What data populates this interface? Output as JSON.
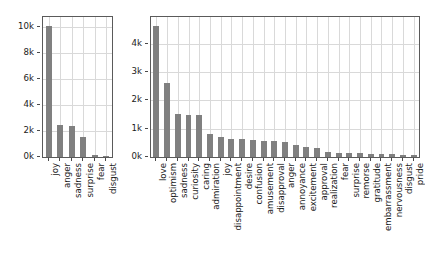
{
  "chart_data": [
    {
      "id": "ekman",
      "type": "bar",
      "title": "",
      "xlabel": "",
      "ylabel": "",
      "categories": [
        "joy",
        "anger",
        "sadness",
        "surprise",
        "fear",
        "disgust"
      ],
      "values": [
        10100,
        2500,
        2420,
        1520,
        160,
        30
      ],
      "ylim": [
        0,
        10800
      ],
      "yticks": [
        0,
        2000,
        4000,
        6000,
        8000,
        10000
      ],
      "ytick_labels": [
        "0k",
        "2k",
        "4k",
        "6k",
        "8k",
        "10k"
      ],
      "grid": true,
      "legend": "none",
      "bar_color": "#808080"
    },
    {
      "id": "goemotions",
      "type": "bar",
      "title": "",
      "xlabel": "",
      "ylabel": "",
      "categories": [
        "love",
        "optimism",
        "sadness",
        "curiosity",
        "caring",
        "admiration",
        "joy",
        "disappointment",
        "desire",
        "confusion",
        "amusement",
        "disapproval",
        "anger",
        "annoyance",
        "excitement",
        "approval",
        "realization",
        "fear",
        "surprise",
        "remorse",
        "gratitude",
        "embarrassment",
        "nervousness",
        "disgust",
        "pride"
      ],
      "values": [
        4620,
        2600,
        1520,
        1490,
        1480,
        820,
        700,
        650,
        620,
        600,
        580,
        560,
        540,
        420,
        360,
        330,
        160,
        150,
        140,
        130,
        120,
        110,
        95,
        80,
        60
      ],
      "ylim": [
        0,
        4950
      ],
      "yticks": [
        0,
        1000,
        2000,
        3000,
        4000
      ],
      "ytick_labels": [
        "0k",
        "1k",
        "2k",
        "3k",
        "4k"
      ],
      "grid": true,
      "legend": "none",
      "bar_color": "#808080"
    }
  ]
}
